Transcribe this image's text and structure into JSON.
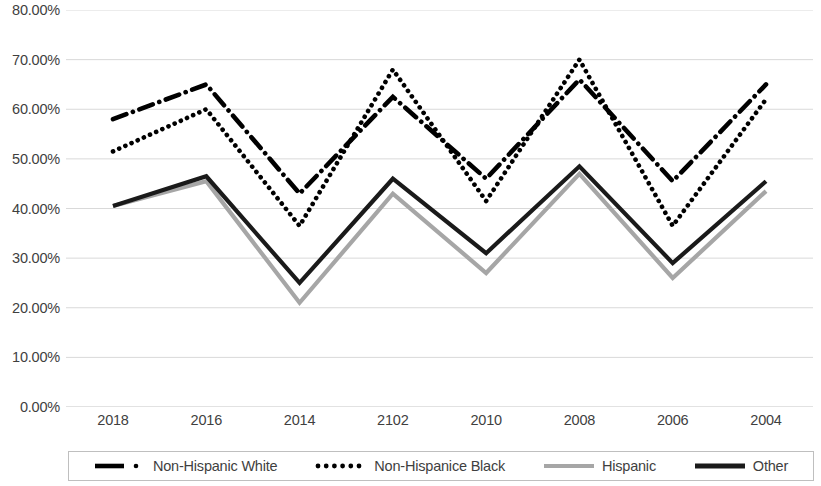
{
  "chart_data": {
    "type": "line",
    "title": "",
    "xlabel": "",
    "ylabel": "",
    "grid": true,
    "legend_position": "bottom",
    "ylim": [
      0,
      80
    ],
    "ytick_format": "percent",
    "categories": [
      "2018",
      "2016",
      "2014",
      "2102",
      "2010",
      "2008",
      "2006",
      "2004"
    ],
    "ytick_labels": [
      "80.00%",
      "70.00%",
      "60.00%",
      "50.00%",
      "40.00%",
      "30.00%",
      "20.00%",
      "10.00%",
      "0.00%"
    ],
    "ytick_values": [
      80,
      70,
      60,
      50,
      40,
      30,
      20,
      10,
      0
    ],
    "series": [
      {
        "name": "Non-Hispanic White",
        "style": "dash-dot",
        "color": "#000000",
        "values": [
          58.0,
          65.0,
          43.0,
          62.5,
          46.0,
          66.0,
          45.5,
          65.0
        ]
      },
      {
        "name": "Non-Hispanice Black",
        "style": "dotted",
        "color": "#000000",
        "values": [
          51.5,
          60.0,
          36.5,
          68.0,
          41.5,
          70.0,
          36.5,
          62.0
        ]
      },
      {
        "name": "Hispanic",
        "style": "solid",
        "color": "#a6a6a6",
        "values": [
          40.5,
          45.5,
          21.0,
          43.0,
          27.0,
          47.0,
          26.0,
          43.5
        ]
      },
      {
        "name": "Other",
        "style": "solid",
        "color": "#1a1a1a",
        "values": [
          40.5,
          46.5,
          25.0,
          46.0,
          31.0,
          48.5,
          29.0,
          45.5
        ]
      }
    ]
  },
  "legend": {
    "items": [
      {
        "label": "Non-Hispanic White",
        "swatch": "dash-dot-swatch"
      },
      {
        "label": "Non-Hispanice Black",
        "swatch": "dotted-swatch"
      },
      {
        "label": "Hispanic",
        "swatch": "solid-gray-swatch"
      },
      {
        "label": "Other",
        "swatch": "solid-black-swatch"
      }
    ]
  }
}
